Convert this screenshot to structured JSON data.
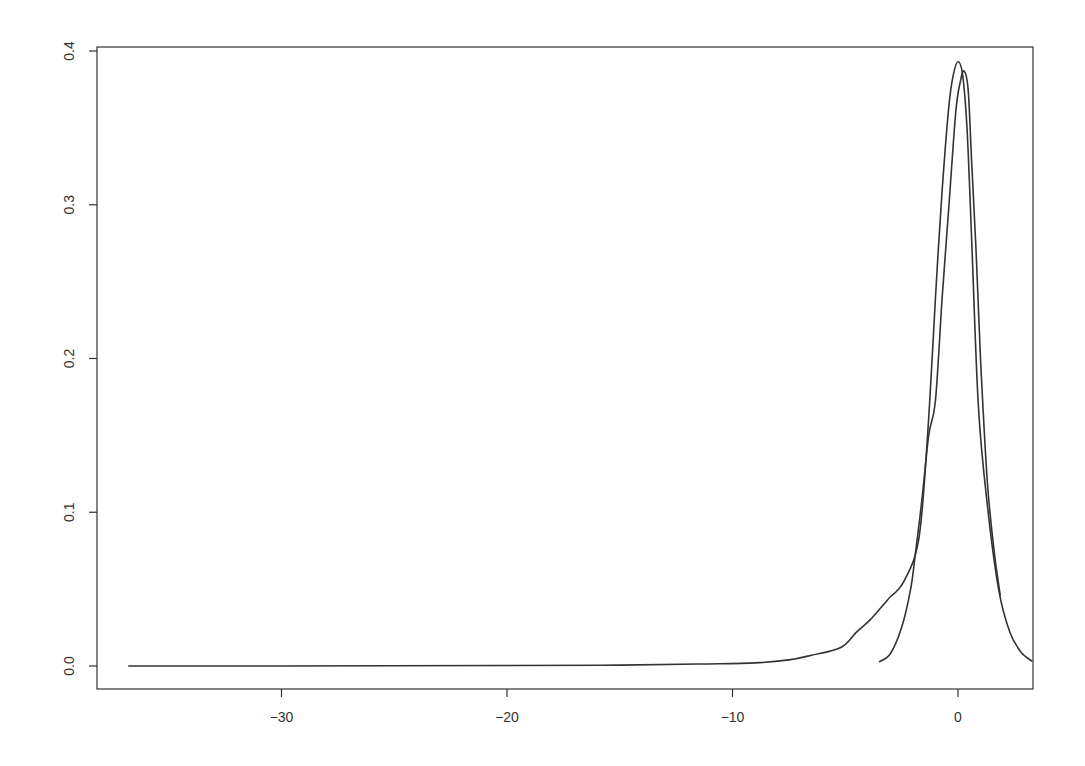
{
  "chart_data": {
    "type": "line",
    "title": "",
    "xlabel": "",
    "ylabel": "",
    "xlim": [
      -38.3,
      3.3
    ],
    "ylim": [
      -0.015,
      0.4
    ],
    "grid": false,
    "legend": null,
    "x_ticks": [
      -30,
      -20,
      -10,
      0
    ],
    "x_tick_labels": [
      "−30",
      "−20",
      "−10",
      "0"
    ],
    "y_ticks": [
      0.0,
      0.1,
      0.2,
      0.3,
      0.4
    ],
    "y_tick_labels": [
      "0.0",
      "0.1",
      "0.2",
      "0.3",
      "0.4"
    ],
    "line_color": "#333333",
    "series": [
      {
        "name": "density-wide",
        "x": [
          -36.8,
          -30,
          -20,
          -15,
          -11.5,
          -9,
          -7.5,
          -6.5,
          -5.2,
          -4.5,
          -3.9,
          -3.3,
          -3.0,
          -2.7,
          -2.4,
          -1.9,
          -1.6,
          -1.25,
          -1.0,
          -0.7,
          -0.4,
          -0.2,
          0.0,
          0.2,
          0.4,
          0.6,
          0.9,
          1.3,
          1.8,
          2.3,
          2.8,
          3.3
        ],
        "y": [
          0.0,
          0.0,
          0.0003,
          0.0006,
          0.0013,
          0.002,
          0.004,
          0.007,
          0.012,
          0.022,
          0.03,
          0.04,
          0.045,
          0.049,
          0.055,
          0.072,
          0.1,
          0.173,
          0.24,
          0.31,
          0.365,
          0.385,
          0.393,
          0.385,
          0.35,
          0.28,
          0.17,
          0.105,
          0.05,
          0.022,
          0.009,
          0.003
        ]
      },
      {
        "name": "density-narrow",
        "x": [
          -3.5,
          -3.0,
          -2.5,
          -2.1,
          -1.9,
          -1.6,
          -1.3,
          -1.0,
          -0.7,
          -0.4,
          -0.1,
          0.1,
          0.27,
          0.45,
          0.6,
          0.8,
          1.0,
          1.3,
          1.6,
          1.87
        ],
        "y": [
          0.0026,
          0.008,
          0.025,
          0.05,
          0.072,
          0.108,
          0.15,
          0.173,
          0.24,
          0.3,
          0.36,
          0.38,
          0.387,
          0.375,
          0.33,
          0.271,
          0.2,
          0.12,
          0.075,
          0.046
        ]
      }
    ]
  }
}
